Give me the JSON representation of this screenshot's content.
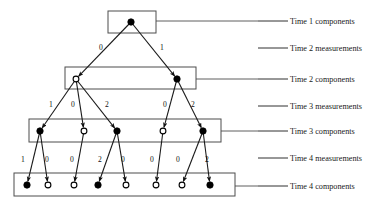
{
  "figure": {
    "type": "trellis-diagram",
    "background_color": "#ffffff",
    "line_color": "#1a1a1a",
    "box_stroke_color": "#4d4d4d",
    "node_fill_color": "#000000",
    "node_open_color": "#ffffff"
  },
  "row_labels": [
    {
      "id": "time-1-components",
      "text": "Time 1 components",
      "x": 290,
      "y": 18,
      "leader_x1": 258,
      "leader_x2": 288,
      "leader_y": 21
    },
    {
      "id": "time-2-measurements",
      "text": "Time 2 measurements",
      "x": 290,
      "y": 45,
      "leader_x1": 258,
      "leader_x2": 288,
      "leader_y": 48
    },
    {
      "id": "time-2-components",
      "text": "Time 2 components",
      "x": 290,
      "y": 76,
      "leader_x1": 258,
      "leader_x2": 288,
      "leader_y": 79
    },
    {
      "id": "time-3-measurements",
      "text": "Time 3 measurements",
      "x": 290,
      "y": 103,
      "leader_x1": 258,
      "leader_x2": 288,
      "leader_y": 106
    },
    {
      "id": "time-3-components",
      "text": "Time 3 components",
      "x": 290,
      "y": 128,
      "leader_x1": 258,
      "leader_x2": 288,
      "leader_y": 131
    },
    {
      "id": "time-4-measurements",
      "text": "Time 4 measurements",
      "x": 290,
      "y": 155,
      "leader_x1": 258,
      "leader_x2": 288,
      "leader_y": 158
    },
    {
      "id": "time-4-components",
      "text": "Time 4 components",
      "x": 290,
      "y": 183,
      "leader_x1": 258,
      "leader_x2": 288,
      "leader_y": 186
    }
  ],
  "boxes": [
    {
      "id": "time-1-box",
      "x": 108,
      "y": 11,
      "w": 48,
      "h": 22
    },
    {
      "id": "time-2-box",
      "x": 65,
      "y": 67,
      "w": 131,
      "h": 22
    },
    {
      "id": "time-3-box",
      "x": 29,
      "y": 119,
      "w": 192,
      "h": 23
    },
    {
      "id": "time-4-box",
      "x": 14,
      "y": 173,
      "w": 221,
      "h": 23
    }
  ],
  "nodes": {
    "time1": [
      {
        "id": "t1-n1",
        "x": 131,
        "y": 22,
        "state": "filled"
      }
    ],
    "time2": [
      {
        "id": "t2-n1",
        "x": 76,
        "y": 79,
        "state": "open"
      },
      {
        "id": "t2-n2",
        "x": 177,
        "y": 79,
        "state": "filled"
      }
    ],
    "time3": [
      {
        "id": "t3-n1",
        "x": 40,
        "y": 131,
        "state": "filled"
      },
      {
        "id": "t3-n2",
        "x": 84,
        "y": 131,
        "state": "open"
      },
      {
        "id": "t3-n3",
        "x": 117,
        "y": 131,
        "state": "filled"
      },
      {
        "id": "t3-n4",
        "x": 163,
        "y": 131,
        "state": "open"
      },
      {
        "id": "t3-n5",
        "x": 203,
        "y": 131,
        "state": "filled"
      }
    ],
    "time4": [
      {
        "id": "t4-n1",
        "x": 27,
        "y": 185,
        "state": "filled"
      },
      {
        "id": "t4-n2",
        "x": 48,
        "y": 185,
        "state": "open"
      },
      {
        "id": "t4-n3",
        "x": 74,
        "y": 185,
        "state": "open"
      },
      {
        "id": "t4-n4",
        "x": 98,
        "y": 185,
        "state": "filled"
      },
      {
        "id": "t4-n5",
        "x": 126,
        "y": 185,
        "state": "open"
      },
      {
        "id": "t4-n6",
        "x": 156,
        "y": 185,
        "state": "open"
      },
      {
        "id": "t4-n7",
        "x": 182,
        "y": 185,
        "state": "open"
      },
      {
        "id": "t4-n8",
        "x": 210,
        "y": 185,
        "state": "filled"
      }
    ]
  },
  "edges": [
    {
      "id": "e-t1n1-t2n1",
      "from": "t1-n1",
      "to": "t2-n1",
      "x1": 131,
      "y1": 22,
      "x2": 76,
      "y2": 79
    },
    {
      "id": "e-t1n1-t2n2",
      "from": "t1-n1",
      "to": "t2-n2",
      "x1": 131,
      "y1": 22,
      "x2": 177,
      "y2": 79
    },
    {
      "id": "e-t2n1-t3n1",
      "from": "t2-n1",
      "to": "t3-n1",
      "x1": 76,
      "y1": 79,
      "x2": 40,
      "y2": 131
    },
    {
      "id": "e-t2n1-t3n2",
      "from": "t2-n1",
      "to": "t3-n2",
      "x1": 76,
      "y1": 79,
      "x2": 84,
      "y2": 131
    },
    {
      "id": "e-t2n1-t3n3",
      "from": "t2-n1",
      "to": "t3-n3",
      "x1": 76,
      "y1": 79,
      "x2": 117,
      "y2": 131
    },
    {
      "id": "e-t2n2-t3n4",
      "from": "t2-n2",
      "to": "t3-n4",
      "x1": 177,
      "y1": 79,
      "x2": 163,
      "y2": 131
    },
    {
      "id": "e-t2n2-t3n5",
      "from": "t2-n2",
      "to": "t3-n5",
      "x1": 177,
      "y1": 79,
      "x2": 203,
      "y2": 131
    },
    {
      "id": "e-t3n1-t4n1",
      "from": "t3-n1",
      "to": "t4-n1",
      "x1": 40,
      "y1": 131,
      "x2": 27,
      "y2": 185
    },
    {
      "id": "e-t3n1-t4n2",
      "from": "t3-n1",
      "to": "t4-n2",
      "x1": 40,
      "y1": 131,
      "x2": 48,
      "y2": 185
    },
    {
      "id": "e-t3n2-t4n3",
      "from": "t3-n2",
      "to": "t4-n3",
      "x1": 84,
      "y1": 131,
      "x2": 74,
      "y2": 185
    },
    {
      "id": "e-t3n3-t4n4",
      "from": "t3-n3",
      "to": "t4-n4",
      "x1": 117,
      "y1": 131,
      "x2": 98,
      "y2": 185
    },
    {
      "id": "e-t3n3-t4n5",
      "from": "t3-n3",
      "to": "t4-n5",
      "x1": 117,
      "y1": 131,
      "x2": 126,
      "y2": 185
    },
    {
      "id": "e-t3n4-t4n6",
      "from": "t3-n4",
      "to": "t4-n6",
      "x1": 163,
      "y1": 131,
      "x2": 156,
      "y2": 185
    },
    {
      "id": "e-t3n5-t4n7",
      "from": "t3-n5",
      "to": "t4-n7",
      "x1": 203,
      "y1": 131,
      "x2": 182,
      "y2": 185
    },
    {
      "id": "e-t3n5-t4n8",
      "from": "t3-n5",
      "to": "t4-n8",
      "x1": 203,
      "y1": 131,
      "x2": 210,
      "y2": 185
    }
  ],
  "edge_labels": {
    "time2_measurements": [
      {
        "id": "m2-1",
        "text": "0",
        "x": 99,
        "y": 44
      },
      {
        "id": "m2-2",
        "text": "1",
        "x": 160,
        "y": 44
      }
    ],
    "time3_measurements": [
      {
        "id": "m3-1",
        "text": "1",
        "x": 49,
        "y": 101
      },
      {
        "id": "m3-2",
        "text": "0",
        "x": 71,
        "y": 101
      },
      {
        "id": "m3-3",
        "text": "2",
        "x": 105,
        "y": 101
      },
      {
        "id": "m3-4",
        "text": "0",
        "x": 163,
        "y": 101
      },
      {
        "id": "m3-5",
        "text": "2",
        "x": 191,
        "y": 101
      }
    ],
    "time4_measurements": [
      {
        "id": "m4-1",
        "text": "1",
        "x": 21,
        "y": 156
      },
      {
        "id": "m4-2",
        "text": "0",
        "x": 45,
        "y": 156
      },
      {
        "id": "m4-3",
        "text": "0",
        "x": 70,
        "y": 156
      },
      {
        "id": "m4-4",
        "text": "2",
        "x": 98,
        "y": 156
      },
      {
        "id": "m4-5",
        "text": "0",
        "x": 121,
        "y": 156
      },
      {
        "id": "m4-6",
        "text": "0",
        "x": 150,
        "y": 156
      },
      {
        "id": "m4-7",
        "text": "0",
        "x": 176,
        "y": 156
      },
      {
        "id": "m4-8",
        "text": "2",
        "x": 205,
        "y": 156
      }
    ]
  }
}
